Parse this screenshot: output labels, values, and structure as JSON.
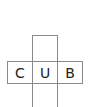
{
  "diagram": {
    "type": "cube-net",
    "line_color": "#8a8a8a",
    "faces": [
      {
        "id": "top",
        "label": ""
      },
      {
        "id": "left",
        "label": "C"
      },
      {
        "id": "center",
        "label": "U"
      },
      {
        "id": "right",
        "label": "B"
      },
      {
        "id": "bottom",
        "label": ""
      }
    ]
  }
}
